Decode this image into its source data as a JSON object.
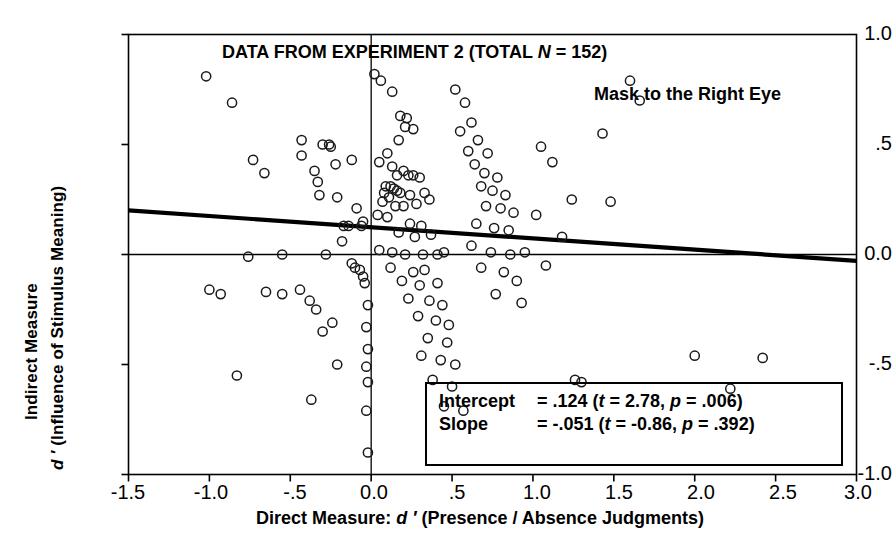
{
  "chart_data": {
    "type": "scatter",
    "title": "DATA FROM EXPERIMENT 2 (TOTAL N = 152)",
    "title_prefix": "DATA FROM EXPERIMENT 2 (TOTAL ",
    "title_italic": "N",
    "title_suffix": " = 152)",
    "subtitle": "Mask to the Right Eye",
    "xlabel_prefix": "Direct Measure: ",
    "xlabel_italic": "d ′",
    "xlabel_suffix": " (Presence / Absence Judgments)",
    "xlabel": "Direct Measure: d ′ (Presence / Absence Judgments)",
    "ylabel_line1": "Indirect Measure",
    "ylabel_line2_italic": "d ′",
    "ylabel_line2_rest": " (Influence of Stimulus Meaning)",
    "ylabel": "Indirect Measure d ′ (Influence of Stimulus Meaning)",
    "xlim": [
      -1.5,
      3.0
    ],
    "ylim": [
      -1.0,
      1.0
    ],
    "xticks": [
      -1.5,
      -1.0,
      -0.5,
      0.0,
      0.5,
      1.0,
      1.5,
      2.0,
      2.5,
      3.0
    ],
    "xtick_labels": [
      "-1.5",
      "-1.0",
      "-.5",
      "0.0",
      ".5",
      "1.0",
      "1.5",
      "2.0",
      "2.5",
      "3.0"
    ],
    "yticks": [
      1.0,
      0.5,
      0.0,
      -0.5,
      -1.0
    ],
    "ytick_labels": [
      "1.0",
      ".5",
      "0.0",
      "-.5",
      "-1.0"
    ],
    "grid": false,
    "legend": "none",
    "reference_lines": [
      {
        "name": "x-zero-vertical",
        "x": 0.0
      },
      {
        "name": "y-zero-horizontal",
        "y": 0.0
      }
    ],
    "marker": "open-circle",
    "n_points": 152,
    "regression": {
      "intercept": 0.124,
      "slope": -0.051,
      "intercept_t": 2.78,
      "intercept_p": 0.006,
      "slope_t": -0.86,
      "slope_p": 0.392
    },
    "points": [
      [
        -1.02,
        0.81
      ],
      [
        -0.86,
        0.69
      ],
      [
        -0.73,
        0.43
      ],
      [
        -0.66,
        0.37
      ],
      [
        -0.43,
        0.52
      ],
      [
        -0.43,
        0.45
      ],
      [
        -0.3,
        0.5
      ],
      [
        -0.26,
        0.5
      ],
      [
        -0.25,
        0.49
      ],
      [
        -0.35,
        0.38
      ],
      [
        -0.33,
        0.33
      ],
      [
        -0.32,
        0.27
      ],
      [
        -0.22,
        0.41
      ],
      [
        -0.21,
        0.26
      ],
      [
        -0.12,
        0.43
      ],
      [
        -0.09,
        0.21
      ],
      [
        -0.17,
        0.13
      ],
      [
        -0.14,
        0.13
      ],
      [
        -0.06,
        0.13
      ],
      [
        -0.05,
        0.15
      ],
      [
        -0.18,
        0.06
      ],
      [
        -0.28,
        0.0
      ],
      [
        -0.55,
        0.0
      ],
      [
        -0.76,
        -0.01
      ],
      [
        -1.0,
        -0.16
      ],
      [
        -0.93,
        -0.18
      ],
      [
        -0.83,
        -0.55
      ],
      [
        -0.65,
        -0.17
      ],
      [
        -0.55,
        -0.18
      ],
      [
        -0.44,
        -0.16
      ],
      [
        -0.38,
        -0.21
      ],
      [
        -0.34,
        -0.25
      ],
      [
        -0.3,
        -0.35
      ],
      [
        -0.24,
        -0.31
      ],
      [
        -0.37,
        -0.66
      ],
      [
        -0.21,
        -0.5
      ],
      [
        -0.12,
        -0.04
      ],
      [
        -0.1,
        -0.06
      ],
      [
        -0.07,
        -0.07
      ],
      [
        -0.05,
        -0.1
      ],
      [
        -0.04,
        -0.13
      ],
      [
        -0.02,
        -0.23
      ],
      [
        -0.03,
        -0.33
      ],
      [
        -0.02,
        -0.43
      ],
      [
        -0.03,
        -0.51
      ],
      [
        -0.02,
        -0.58
      ],
      [
        -0.03,
        -0.71
      ],
      [
        -0.02,
        -0.9
      ],
      [
        0.02,
        0.82
      ],
      [
        0.06,
        0.79
      ],
      [
        0.13,
        0.74
      ],
      [
        0.18,
        0.63
      ],
      [
        0.22,
        0.62
      ],
      [
        0.21,
        0.58
      ],
      [
        0.26,
        0.57
      ],
      [
        0.17,
        0.52
      ],
      [
        0.1,
        0.46
      ],
      [
        0.05,
        0.42
      ],
      [
        0.13,
        0.4
      ],
      [
        0.2,
        0.38
      ],
      [
        0.16,
        0.36
      ],
      [
        0.23,
        0.36
      ],
      [
        0.26,
        0.36
      ],
      [
        0.3,
        0.35
      ],
      [
        0.09,
        0.31
      ],
      [
        0.12,
        0.31
      ],
      [
        0.14,
        0.3
      ],
      [
        0.16,
        0.29
      ],
      [
        0.08,
        0.28
      ],
      [
        0.11,
        0.26
      ],
      [
        0.18,
        0.28
      ],
      [
        0.24,
        0.27
      ],
      [
        0.33,
        0.28
      ],
      [
        0.07,
        0.24
      ],
      [
        0.15,
        0.22
      ],
      [
        0.2,
        0.22
      ],
      [
        0.28,
        0.23
      ],
      [
        0.36,
        0.25
      ],
      [
        0.04,
        0.18
      ],
      [
        0.1,
        0.17
      ],
      [
        0.24,
        0.14
      ],
      [
        0.31,
        0.13
      ],
      [
        0.17,
        0.1
      ],
      [
        0.27,
        0.08
      ],
      [
        0.37,
        0.09
      ],
      [
        0.05,
        0.02
      ],
      [
        0.13,
        0.01
      ],
      [
        0.21,
        0.0
      ],
      [
        0.32,
        0.0
      ],
      [
        0.41,
        0.0
      ],
      [
        0.45,
        0.01
      ],
      [
        0.12,
        -0.06
      ],
      [
        0.26,
        -0.08
      ],
      [
        0.33,
        -0.07
      ],
      [
        0.19,
        -0.12
      ],
      [
        0.3,
        -0.14
      ],
      [
        0.41,
        -0.13
      ],
      [
        0.23,
        -0.2
      ],
      [
        0.36,
        -0.21
      ],
      [
        0.44,
        -0.23
      ],
      [
        0.29,
        -0.28
      ],
      [
        0.4,
        -0.3
      ],
      [
        0.48,
        -0.32
      ],
      [
        0.35,
        -0.38
      ],
      [
        0.47,
        -0.4
      ],
      [
        0.31,
        -0.46
      ],
      [
        0.43,
        -0.48
      ],
      [
        0.52,
        -0.5
      ],
      [
        0.38,
        -0.57
      ],
      [
        0.5,
        -0.6
      ],
      [
        0.45,
        -0.69
      ],
      [
        0.57,
        -0.71
      ],
      [
        0.52,
        0.75
      ],
      [
        0.58,
        0.69
      ],
      [
        0.62,
        0.6
      ],
      [
        0.55,
        0.56
      ],
      [
        0.66,
        0.52
      ],
      [
        0.6,
        0.47
      ],
      [
        0.72,
        0.46
      ],
      [
        0.64,
        0.41
      ],
      [
        0.7,
        0.37
      ],
      [
        0.78,
        0.35
      ],
      [
        0.68,
        0.31
      ],
      [
        0.75,
        0.29
      ],
      [
        0.83,
        0.27
      ],
      [
        0.71,
        0.22
      ],
      [
        0.8,
        0.21
      ],
      [
        0.88,
        0.19
      ],
      [
        0.65,
        0.14
      ],
      [
        0.76,
        0.12
      ],
      [
        0.85,
        0.11
      ],
      [
        0.62,
        0.04
      ],
      [
        0.74,
        0.01
      ],
      [
        0.86,
        0.0
      ],
      [
        0.95,
        0.01
      ],
      [
        0.68,
        -0.06
      ],
      [
        0.82,
        -0.08
      ],
      [
        0.9,
        -0.12
      ],
      [
        0.77,
        -0.18
      ],
      [
        0.93,
        -0.22
      ],
      [
        1.05,
        0.49
      ],
      [
        1.12,
        0.42
      ],
      [
        1.24,
        0.25
      ],
      [
        1.02,
        0.18
      ],
      [
        1.18,
        0.08
      ],
      [
        1.08,
        -0.05
      ],
      [
        1.26,
        -0.57
      ],
      [
        1.3,
        -0.58
      ],
      [
        1.43,
        0.55
      ],
      [
        1.6,
        0.79
      ],
      [
        1.66,
        0.7
      ],
      [
        1.48,
        0.24
      ],
      [
        2.0,
        -0.46
      ],
      [
        2.22,
        -0.61
      ],
      [
        2.42,
        -0.47
      ]
    ]
  }
}
